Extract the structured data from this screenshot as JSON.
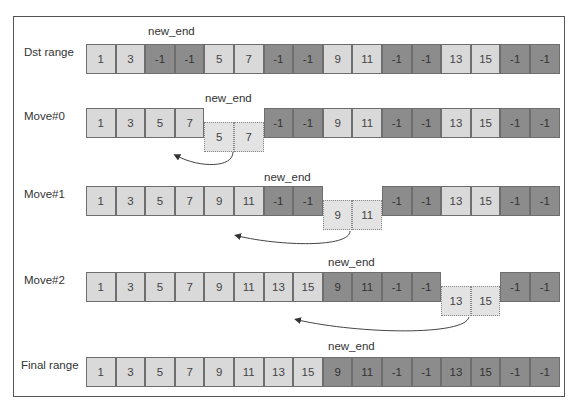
{
  "colors": {
    "light_cell": "#d9d9d9",
    "dark_cell": "#8c8c8c",
    "moved_cell": "#e3e3e3",
    "border": "#6e6e6e"
  },
  "new_end_label": "new_end",
  "rows": [
    {
      "label": "Dst range",
      "y": 44,
      "new_end_x": 148,
      "new_end_y": 25,
      "cells": [
        {
          "v": "1",
          "t": "light"
        },
        {
          "v": "3",
          "t": "light"
        },
        {
          "v": "-1",
          "t": "dark"
        },
        {
          "v": "-1",
          "t": "dark"
        },
        {
          "v": "5",
          "t": "light"
        },
        {
          "v": "7",
          "t": "light"
        },
        {
          "v": "-1",
          "t": "dark"
        },
        {
          "v": "-1",
          "t": "dark"
        },
        {
          "v": "9",
          "t": "light"
        },
        {
          "v": "11",
          "t": "light"
        },
        {
          "v": "-1",
          "t": "dark"
        },
        {
          "v": "-1",
          "t": "dark"
        },
        {
          "v": "13",
          "t": "light"
        },
        {
          "v": "15",
          "t": "light"
        },
        {
          "v": "-1",
          "t": "dark"
        },
        {
          "v": "-1",
          "t": "dark"
        }
      ]
    },
    {
      "label": "Move#0",
      "y": 108,
      "new_end_x": 205,
      "new_end_y": 92,
      "cells": [
        {
          "v": "1",
          "t": "light"
        },
        {
          "v": "3",
          "t": "light"
        },
        {
          "v": "5",
          "t": "light"
        },
        {
          "v": "7",
          "t": "light"
        },
        {
          "v": "5",
          "t": "moved"
        },
        {
          "v": "7",
          "t": "moved"
        },
        {
          "v": "-1",
          "t": "dark"
        },
        {
          "v": "-1",
          "t": "dark"
        },
        {
          "v": "9",
          "t": "light"
        },
        {
          "v": "11",
          "t": "light"
        },
        {
          "v": "-1",
          "t": "dark"
        },
        {
          "v": "-1",
          "t": "dark"
        },
        {
          "v": "13",
          "t": "light"
        },
        {
          "v": "15",
          "t": "light"
        },
        {
          "v": "-1",
          "t": "dark"
        },
        {
          "v": "-1",
          "t": "dark"
        }
      ]
    },
    {
      "label": "Move#1",
      "y": 186,
      "new_end_x": 264,
      "new_end_y": 171,
      "cells": [
        {
          "v": "1",
          "t": "light"
        },
        {
          "v": "3",
          "t": "light"
        },
        {
          "v": "5",
          "t": "light"
        },
        {
          "v": "7",
          "t": "light"
        },
        {
          "v": "9",
          "t": "light"
        },
        {
          "v": "11",
          "t": "light"
        },
        {
          "v": "-1",
          "t": "dark"
        },
        {
          "v": "-1",
          "t": "dark"
        },
        {
          "v": "9",
          "t": "moved"
        },
        {
          "v": "11",
          "t": "moved"
        },
        {
          "v": "-1",
          "t": "dark"
        },
        {
          "v": "-1",
          "t": "dark"
        },
        {
          "v": "13",
          "t": "light"
        },
        {
          "v": "15",
          "t": "light"
        },
        {
          "v": "-1",
          "t": "dark"
        },
        {
          "v": "-1",
          "t": "dark"
        }
      ]
    },
    {
      "label": "Move#2",
      "y": 272,
      "new_end_x": 328,
      "new_end_y": 256,
      "cells": [
        {
          "v": "1",
          "t": "light"
        },
        {
          "v": "3",
          "t": "light"
        },
        {
          "v": "5",
          "t": "light"
        },
        {
          "v": "7",
          "t": "light"
        },
        {
          "v": "9",
          "t": "light"
        },
        {
          "v": "11",
          "t": "light"
        },
        {
          "v": "13",
          "t": "light"
        },
        {
          "v": "15",
          "t": "light"
        },
        {
          "v": "9",
          "t": "dark"
        },
        {
          "v": "11",
          "t": "dark"
        },
        {
          "v": "-1",
          "t": "dark"
        },
        {
          "v": "-1",
          "t": "dark"
        },
        {
          "v": "13",
          "t": "moved"
        },
        {
          "v": "15",
          "t": "moved"
        },
        {
          "v": "-1",
          "t": "dark"
        },
        {
          "v": "-1",
          "t": "dark"
        }
      ]
    },
    {
      "label": "Final range",
      "y": 357,
      "new_end_x": 328,
      "new_end_y": 340,
      "cells": [
        {
          "v": "1",
          "t": "light"
        },
        {
          "v": "3",
          "t": "light"
        },
        {
          "v": "5",
          "t": "light"
        },
        {
          "v": "7",
          "t": "light"
        },
        {
          "v": "9",
          "t": "light"
        },
        {
          "v": "11",
          "t": "light"
        },
        {
          "v": "13",
          "t": "light"
        },
        {
          "v": "15",
          "t": "light"
        },
        {
          "v": "9",
          "t": "dark"
        },
        {
          "v": "11",
          "t": "dark"
        },
        {
          "v": "-1",
          "t": "dark"
        },
        {
          "v": "-1",
          "t": "dark"
        },
        {
          "v": "13",
          "t": "dark"
        },
        {
          "v": "15",
          "t": "dark"
        },
        {
          "v": "-1",
          "t": "dark"
        },
        {
          "v": "-1",
          "t": "dark"
        }
      ]
    }
  ]
}
